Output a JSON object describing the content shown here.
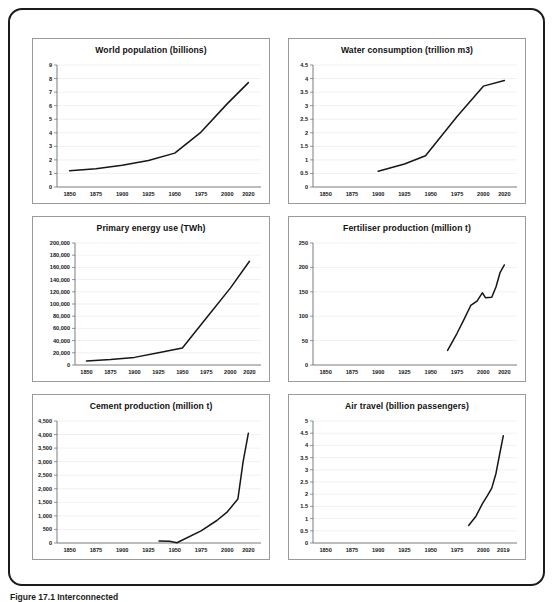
{
  "figure": {
    "caption": "Figure 17.1  Interconnected"
  },
  "chart_data": [
    {
      "id": "world-population",
      "type": "line",
      "title": "World population (billions)",
      "xlabel": "",
      "ylabel": "",
      "xtick_labels": [
        "1850",
        "1875",
        "1900",
        "1925",
        "1950",
        "1975",
        "2000",
        "2020"
      ],
      "xticks": [
        1850,
        1875,
        1900,
        1925,
        1950,
        1975,
        2000,
        2020
      ],
      "ytick_labels": [
        "0",
        "1",
        "2",
        "3",
        "4",
        "5",
        "6",
        "7",
        "8",
        "9"
      ],
      "yticks": [
        0,
        1,
        2,
        3,
        4,
        5,
        6,
        7,
        8,
        9
      ],
      "xlim": [
        1838,
        2032
      ],
      "ylim": [
        0,
        9
      ],
      "grid": true,
      "legend": "none",
      "x": [
        1850,
        1875,
        1900,
        1925,
        1950,
        1975,
        2000,
        2020
      ],
      "values": [
        1.2,
        1.35,
        1.6,
        1.95,
        2.5,
        4.05,
        6.15,
        7.7
      ]
    },
    {
      "id": "water-consumption",
      "type": "line",
      "title": "Water consumption (trillion m3)",
      "xlabel": "",
      "ylabel": "",
      "xtick_labels": [
        "1850",
        "1875",
        "1900",
        "1925",
        "1950",
        "1975",
        "2000",
        "2020"
      ],
      "xticks": [
        1850,
        1875,
        1900,
        1925,
        1950,
        1975,
        2000,
        2020
      ],
      "ytick_labels": [
        "0",
        "0.5",
        "1",
        "1.5",
        "2",
        "2.5",
        "3",
        "3.5",
        "4",
        "4.5"
      ],
      "yticks": [
        0,
        0.5,
        1,
        1.5,
        2,
        2.5,
        3,
        3.5,
        4,
        4.5
      ],
      "xlim": [
        1838,
        2032
      ],
      "ylim": [
        0,
        4.5
      ],
      "grid": true,
      "legend": "none",
      "x": [
        1900,
        1925,
        1945,
        1975,
        2000,
        2020
      ],
      "values": [
        0.58,
        0.85,
        1.15,
        2.6,
        3.72,
        3.93
      ]
    },
    {
      "id": "primary-energy-use",
      "type": "line",
      "title": "Primary energy use (TWh)",
      "xlabel": "",
      "ylabel": "",
      "xtick_labels": [
        "1850",
        "1875",
        "1900",
        "1925",
        "1950",
        "1975",
        "2000",
        "2020"
      ],
      "xticks": [
        1850,
        1875,
        1900,
        1925,
        1950,
        1975,
        2000,
        2020
      ],
      "ytick_labels": [
        "0",
        "20,000",
        "40,000",
        "60,000",
        "80,000",
        "100,000",
        "120,000",
        "140,000",
        "160,000",
        "180,000",
        "200,000"
      ],
      "yticks": [
        0,
        20000,
        40000,
        60000,
        80000,
        100000,
        120000,
        140000,
        160000,
        180000,
        200000
      ],
      "xlim": [
        1838,
        2032
      ],
      "ylim": [
        0,
        200000
      ],
      "grid": true,
      "legend": "none",
      "x": [
        1850,
        1875,
        1900,
        1925,
        1950,
        1975,
        2000,
        2020
      ],
      "values": [
        6500,
        9000,
        12500,
        20000,
        28000,
        77000,
        126000,
        170000
      ]
    },
    {
      "id": "fertiliser-production",
      "type": "line",
      "title": "Fertiliser production (million t)",
      "xlabel": "",
      "ylabel": "",
      "xtick_labels": [
        "1850",
        "1875",
        "1900",
        "1925",
        "1950",
        "1975",
        "2000",
        "2020"
      ],
      "xticks": [
        1850,
        1875,
        1900,
        1925,
        1950,
        1975,
        2000,
        2020
      ],
      "ytick_labels": [
        "0",
        "50",
        "100",
        "150",
        "200",
        "250"
      ],
      "yticks": [
        0,
        50,
        100,
        150,
        200,
        250
      ],
      "xlim": [
        1838,
        2032
      ],
      "ylim": [
        0,
        250
      ],
      "grid": true,
      "legend": "none",
      "x": [
        1966,
        1975,
        1982,
        1988,
        1994,
        1999,
        2002,
        2008,
        2012,
        2016,
        2020
      ],
      "values": [
        30,
        65,
        95,
        122,
        131,
        148,
        138,
        139,
        160,
        190,
        205
      ]
    },
    {
      "id": "cement-production",
      "type": "line",
      "title": "Cement production (million t)",
      "xlabel": "",
      "ylabel": "",
      "xtick_labels": [
        "1850",
        "1875",
        "1900",
        "1925",
        "1950",
        "1975",
        "2000",
        "2020"
      ],
      "xticks": [
        1850,
        1875,
        1900,
        1925,
        1950,
        1975,
        2000,
        2020
      ],
      "ytick_labels": [
        "0",
        "500",
        "1,000",
        "1,500",
        "2,000",
        "2,500",
        "3,000",
        "3,500",
        "4,000",
        "4,500"
      ],
      "yticks": [
        0,
        500,
        1000,
        1500,
        2000,
        2500,
        3000,
        3500,
        4000,
        4500
      ],
      "xlim": [
        1838,
        2032
      ],
      "ylim": [
        0,
        4500
      ],
      "grid": true,
      "legend": "none",
      "x": [
        1935,
        1945,
        1952,
        1975,
        1990,
        2000,
        2010,
        2015,
        2020
      ],
      "values": [
        70,
        65,
        10,
        450,
        830,
        1150,
        1620,
        3000,
        4050
      ]
    },
    {
      "id": "air-travel",
      "type": "line",
      "title": "Air travel (billion passengers)",
      "xlabel": "",
      "ylabel": "",
      "xtick_labels": [
        "1850",
        "1875",
        "1900",
        "1925",
        "1950",
        "1975",
        "2000",
        "2019"
      ],
      "xticks": [
        1850,
        1875,
        1900,
        1925,
        1950,
        1975,
        2000,
        2019
      ],
      "ytick_labels": [
        "0",
        "0.5",
        "1",
        "1.5",
        "2",
        "2.5",
        "3",
        "3.5",
        "4",
        "4.5",
        "5"
      ],
      "yticks": [
        0,
        0.5,
        1,
        1.5,
        2,
        2.5,
        3,
        3.5,
        4,
        4.5,
        5
      ],
      "xlim": [
        1838,
        2032
      ],
      "ylim": [
        0,
        5
      ],
      "grid": true,
      "legend": "none",
      "x": [
        1986,
        1993,
        1999,
        2004,
        2008,
        2012,
        2016,
        2019
      ],
      "values": [
        0.72,
        1.1,
        1.6,
        1.95,
        2.25,
        2.85,
        3.75,
        4.4
      ]
    }
  ]
}
